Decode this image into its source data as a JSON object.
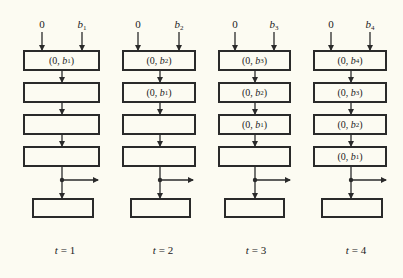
{
  "diagram": {
    "type": "systolic-shift-register-timesteps",
    "background": "#fcfbf2",
    "line_color": "#2a2a2a",
    "columns": [
      {
        "inputs": {
          "left": "0",
          "right_var": "b",
          "right_sub": "1"
        },
        "registers": [
          {
            "filled": true,
            "first": "0",
            "var": "b",
            "sub": "1"
          },
          {
            "filled": false
          },
          {
            "filled": false
          },
          {
            "filled": false
          }
        ],
        "time_label": {
          "var": "t",
          "eq": "=",
          "value": "1"
        }
      },
      {
        "inputs": {
          "left": "0",
          "right_var": "b",
          "right_sub": "2"
        },
        "registers": [
          {
            "filled": true,
            "first": "0",
            "var": "b",
            "sub": "2"
          },
          {
            "filled": true,
            "first": "0",
            "var": "b",
            "sub": "1"
          },
          {
            "filled": false
          },
          {
            "filled": false
          }
        ],
        "time_label": {
          "var": "t",
          "eq": "=",
          "value": "2"
        }
      },
      {
        "inputs": {
          "left": "0",
          "right_var": "b",
          "right_sub": "3"
        },
        "registers": [
          {
            "filled": true,
            "first": "0",
            "var": "b",
            "sub": "3"
          },
          {
            "filled": true,
            "first": "0",
            "var": "b",
            "sub": "2"
          },
          {
            "filled": true,
            "first": "0",
            "var": "b",
            "sub": "1"
          },
          {
            "filled": false
          }
        ],
        "time_label": {
          "var": "t",
          "eq": "=",
          "value": "3"
        }
      },
      {
        "inputs": {
          "left": "0",
          "right_var": "b",
          "right_sub": "4"
        },
        "registers": [
          {
            "filled": true,
            "first": "0",
            "var": "b",
            "sub": "4"
          },
          {
            "filled": true,
            "first": "0",
            "var": "b",
            "sub": "3"
          },
          {
            "filled": true,
            "first": "0",
            "var": "b",
            "sub": "2"
          },
          {
            "filled": true,
            "first": "0",
            "var": "b",
            "sub": "1"
          }
        ],
        "time_label": {
          "var": "t",
          "eq": "=",
          "value": "4"
        }
      }
    ]
  }
}
